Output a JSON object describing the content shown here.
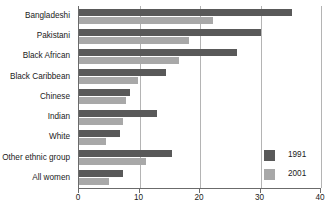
{
  "chart_data": {
    "type": "bar",
    "orientation": "horizontal",
    "title": "",
    "subtitle": "",
    "xlabel": "",
    "ylabel": "",
    "xlim": [
      0,
      40
    ],
    "xticks": [
      0,
      10,
      20,
      30,
      40
    ],
    "xtick_labels": [
      "0",
      "10",
      "20",
      "30",
      "40"
    ],
    "grid": true,
    "grid_axis": "x",
    "legend_position": "bottom-right",
    "categories": [
      "Bangladeshi",
      "Pakistani",
      "Black African",
      "Black Caribbean",
      "Chinese",
      "Indian",
      "White",
      "Other ethnic group",
      "All women"
    ],
    "series": [
      {
        "name": "1991",
        "color": "#595959",
        "values": [
          35.2,
          30.0,
          26.1,
          14.4,
          8.4,
          12.9,
          6.8,
          15.4,
          7.2
        ]
      },
      {
        "name": "2001",
        "color": "#a8a8a8",
        "values": [
          22.1,
          18.2,
          16.5,
          9.8,
          7.8,
          7.3,
          4.4,
          11.0,
          5.0
        ]
      }
    ]
  },
  "legend": {
    "entries": [
      {
        "label": "1991",
        "swatch_color": "#595959"
      },
      {
        "label": "2001",
        "swatch_color": "#a8a8a8"
      }
    ]
  },
  "colors": {
    "series_1991": "#595959",
    "series_2001": "#a8a8a8",
    "axis": "#6b6b6b",
    "gridline": "#b4b4b4",
    "text": "#1a1a1a",
    "background": "#ffffff"
  }
}
